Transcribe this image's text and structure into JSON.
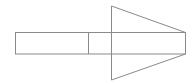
{
  "diagram": {
    "width": 193,
    "height": 84,
    "background": "#ffffff",
    "stroke_color": "#8a8a8a",
    "stroke_width": 1,
    "shapes": [
      {
        "name": "shaft-rectangle",
        "type": "rect",
        "x": 15.5,
        "y": 32.5,
        "width": 170,
        "height": 21.5
      },
      {
        "name": "shaft-divider",
        "type": "line",
        "x1": 88.5,
        "y1": 32.5,
        "x2": 88.5,
        "y2": 54
      },
      {
        "name": "arrowhead",
        "type": "polygon",
        "points": "111.5,6 185.5,32.5 185.5,54 111.5,80"
      }
    ]
  }
}
